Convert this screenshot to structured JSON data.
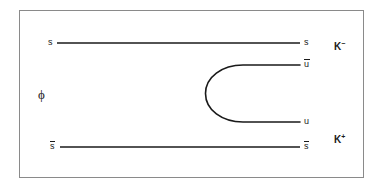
{
  "figure": {
    "name": "phi-to-kaon-pair-quark-line-diagram",
    "background_color": "#ffffff",
    "line_color": "#1a1a1a",
    "border_color": "#8a8a8a"
  },
  "initial_state": {
    "label": "ϕ"
  },
  "quark_lines": [
    {
      "name": "s-quark-line",
      "left_label": "s",
      "right_label": "s",
      "left_has_bar": false,
      "right_has_bar": false,
      "y": 43,
      "x_start": 57,
      "x_end": 300
    },
    {
      "name": "sbar-antiquark-line",
      "left_label": "s",
      "right_label": "s",
      "left_has_bar": true,
      "right_has_bar": true,
      "y": 147,
      "x_start": 60,
      "x_end": 300
    }
  ],
  "created_pair": {
    "name": "u-ubar-pair-loop",
    "upper_label": "u",
    "upper_has_bar": true,
    "lower_label": "u",
    "lower_has_bar": false,
    "upper_y": 65,
    "lower_y": 122,
    "vertex_x": 205,
    "x_end": 300
  },
  "final_state": [
    {
      "name": "k-minus",
      "symbol": "K",
      "charge": "−",
      "x": 334,
      "y": 42
    },
    {
      "name": "k-plus",
      "symbol": "K",
      "charge": "+",
      "x": 334,
      "y": 135
    }
  ],
  "frame": {
    "x": 19,
    "y": 10,
    "width": 345,
    "height": 168
  }
}
